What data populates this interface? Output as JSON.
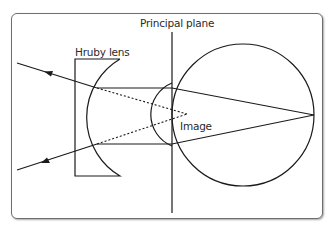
{
  "diagram": {
    "labels": {
      "principal_plane": "Principal plane",
      "hruby_lens": "Hruby lens",
      "image": "Image"
    },
    "colors": {
      "stroke": "#1a1a1a",
      "frame": "#6e6e6e",
      "background": "#ffffff"
    },
    "elements": [
      "principal-plane-line",
      "hruby-lens",
      "eye-globe",
      "cornea",
      "incoming-rays-with-arrows",
      "virtual-ray-extensions-dotted",
      "image-point"
    ]
  }
}
